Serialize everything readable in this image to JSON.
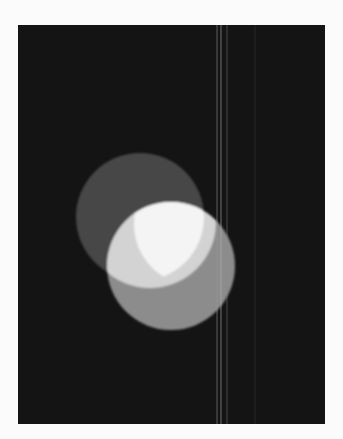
{
  "image": {
    "description": "Photograph of overlapping translucent light discs on a black background with thin vertical light streaks",
    "background_color": "#ffffff",
    "panel": {
      "x": 18,
      "y": 25,
      "width": 307,
      "height": 399,
      "color": "#141414"
    },
    "streaks": [
      {
        "x": 217,
        "color": "#9a9a9a",
        "opacity": 0.55
      },
      {
        "x": 221,
        "color": "#b0b0b0",
        "opacity": 0.6
      },
      {
        "x": 227,
        "color": "#8a8a8a",
        "opacity": 0.45
      },
      {
        "x": 255,
        "color": "#4a4a4a",
        "opacity": 0.35
      }
    ],
    "discs": [
      {
        "name": "dark-disc",
        "cx": 140,
        "cy": 217,
        "r": 64,
        "color": "#474747"
      },
      {
        "name": "gray-disc",
        "cx": 171,
        "cy": 266,
        "r": 64,
        "color": "#8c8c8c"
      },
      {
        "name": "light-region-disc",
        "cx": 150,
        "cy": 222,
        "r": 66,
        "color": "#d3d3d3"
      },
      {
        "name": "white-lens-disc",
        "cx": 196,
        "cy": 224,
        "r": 62,
        "color": "#f4f4f4"
      }
    ]
  }
}
